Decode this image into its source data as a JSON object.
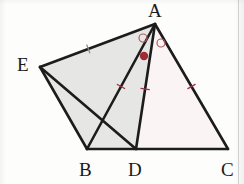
{
  "figure": {
    "kind": "euclidean-geometry-diagram",
    "canvas": {
      "width": 244,
      "height": 184,
      "background": "#fdfdfb"
    },
    "stroke_color": "#1c1c1c",
    "mark_color": "#a03341",
    "fills": {
      "left_region": "#e6e6e4",
      "right_region": "#fbf4f5"
    },
    "points": {
      "A": {
        "x": 155,
        "y": 24,
        "label": "A",
        "label_x": 148,
        "label_y": 1
      },
      "B": {
        "x": 87,
        "y": 149,
        "label": "B",
        "label_x": 79,
        "label_y": 160
      },
      "C": {
        "x": 228,
        "y": 149,
        "label": "C",
        "label_x": 221,
        "label_y": 160
      },
      "D": {
        "x": 136,
        "y": 149,
        "label": "D",
        "label_x": 128,
        "label_y": 160
      },
      "E": {
        "x": 40,
        "y": 67,
        "label": "E",
        "label_x": 17,
        "label_y": 55
      }
    },
    "segments": [
      {
        "name": "AB",
        "from": "A",
        "to": "B",
        "width": 2.6
      },
      {
        "name": "AC",
        "from": "A",
        "to": "C",
        "width": 2.6
      },
      {
        "name": "BC",
        "from": "B",
        "to": "C",
        "width": 2.6
      },
      {
        "name": "AE",
        "from": "A",
        "to": "E",
        "width": 2.6
      },
      {
        "name": "EB",
        "from": "E",
        "to": "B",
        "width": 2.6
      },
      {
        "name": "ED",
        "from": "E",
        "to": "D",
        "width": 2.6
      },
      {
        "name": "AD",
        "from": "A",
        "to": "D",
        "width": 2.6
      }
    ],
    "tick_marks": [
      {
        "name": "tick-AE",
        "segment": "AE",
        "t": 0.58,
        "color": "#8a8a8a"
      },
      {
        "name": "tick-AB",
        "segment": "AB",
        "t": 0.5,
        "color": "#a03341"
      },
      {
        "name": "tick-AD",
        "segment": "AD",
        "t": 0.52,
        "color": "#a03341"
      },
      {
        "name": "tick-AC",
        "segment": "AC",
        "t": 0.5,
        "color": "#a03341"
      }
    ],
    "angle_marks": [
      {
        "name": "angle-mark-open-left",
        "cx": 143,
        "cy": 38,
        "r": 4.0,
        "filled": false,
        "color": "#b05a66"
      },
      {
        "name": "angle-mark-open-right",
        "cx": 161,
        "cy": 43,
        "r": 4.0,
        "filled": false,
        "color": "#b05a66"
      },
      {
        "name": "angle-mark-filled",
        "cx": 144,
        "cy": 56,
        "r": 4.2,
        "filled": true,
        "color": "#9e2b36"
      }
    ]
  }
}
